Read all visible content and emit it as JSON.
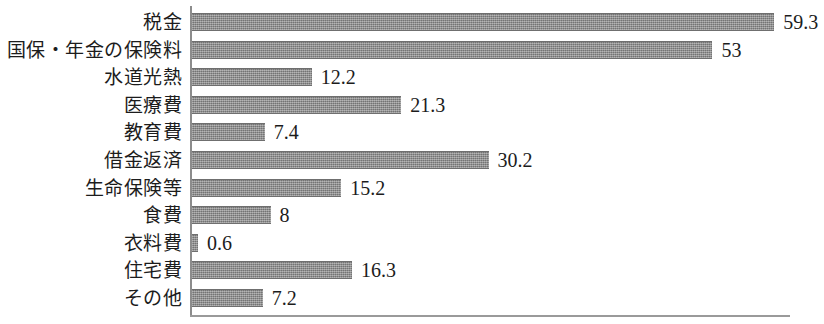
{
  "chart_data": {
    "type": "bar",
    "orientation": "horizontal",
    "title": "",
    "subtitle": "",
    "xlabel": "",
    "ylabel": "",
    "categories": [
      "税金",
      "国保・年金の保険料",
      "水道光熱",
      "医療費",
      "教育費",
      "借金返済",
      "生命保険等",
      "食費",
      "衣料費",
      "住宅費",
      "その他"
    ],
    "values": [
      59.3,
      53,
      12.2,
      21.3,
      7.4,
      30.2,
      15.2,
      8,
      0.6,
      16.3,
      7.2
    ],
    "value_labels": [
      "59.3",
      "53",
      "12.2",
      "21.3",
      "7.4",
      "30.2",
      "15.2",
      "8",
      "0.6",
      "16.3",
      "7.2"
    ],
    "xlim": [
      0,
      60.9
    ],
    "grid": false,
    "legend": null,
    "bar_color": "#8a8a8a",
    "axis_color": "#8c8c8c",
    "background_color": "#ffffff"
  }
}
